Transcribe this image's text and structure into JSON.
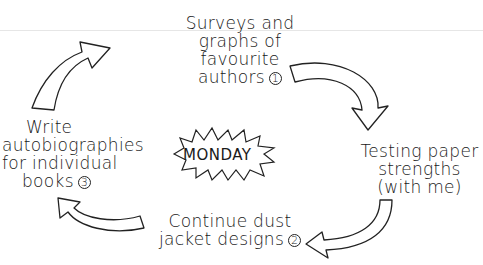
{
  "diagram": {
    "center": {
      "label": "MONDAY"
    },
    "steps": [
      {
        "id": 1,
        "lines": [
          "Surveys and",
          "graphs of",
          "favourite",
          "authors"
        ],
        "number": "1"
      },
      {
        "id": 2,
        "lines": [
          "Testing paper",
          "strengths",
          "(with me)"
        ],
        "number": ""
      },
      {
        "id": 3,
        "lines": [
          "Continue dust",
          "jacket designs"
        ],
        "number": "2"
      },
      {
        "id": 4,
        "lines": [
          "Write",
          "autobiographies",
          "for individual",
          "books"
        ],
        "number": "3"
      }
    ],
    "arrows": [
      "arrow-to-surveys",
      "arrow-to-testing",
      "arrow-to-dust-jacket",
      "arrow-to-autobiographies"
    ]
  }
}
